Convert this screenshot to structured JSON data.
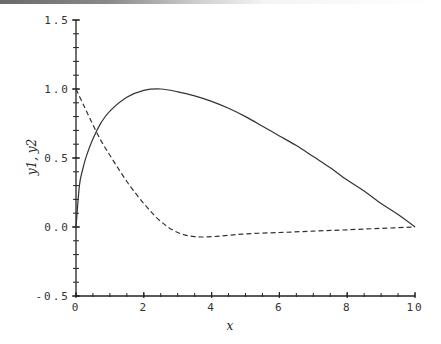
{
  "chart_data": {
    "type": "line",
    "title": "",
    "xlabel": "x",
    "ylabel": "y1, y2",
    "xlim": [
      0,
      10
    ],
    "ylim": [
      -0.5,
      1.5
    ],
    "xticks": [
      0,
      2,
      4,
      6,
      8,
      10
    ],
    "xtick_labels": [
      "0",
      "2",
      "4",
      "6",
      "8",
      "10"
    ],
    "yticks": [
      -0.5,
      0.0,
      0.5,
      1.0,
      1.5
    ],
    "ytick_labels": [
      "-0.5",
      "0.0",
      "0.5",
      "1.0",
      "1.5"
    ],
    "x_minor_step": 0.5,
    "y_minor_step": 0.1,
    "grid": false,
    "legend": null,
    "series": [
      {
        "name": "y1",
        "style": "solid",
        "x": [
          0,
          0.1,
          0.2,
          0.3,
          0.5,
          0.75,
          1.0,
          1.5,
          2.0,
          2.5,
          3.0,
          3.5,
          4.0,
          4.5,
          5.0,
          5.5,
          6.0,
          6.5,
          7.0,
          7.5,
          8.0,
          8.5,
          9.0,
          9.5,
          10.0
        ],
        "y": [
          0.0,
          0.3,
          0.42,
          0.51,
          0.64,
          0.76,
          0.84,
          0.94,
          0.99,
          1.0,
          0.98,
          0.95,
          0.91,
          0.86,
          0.8,
          0.73,
          0.66,
          0.59,
          0.51,
          0.43,
          0.34,
          0.26,
          0.17,
          0.09,
          0.0
        ]
      },
      {
        "name": "y2",
        "style": "dashed",
        "x": [
          0,
          0.25,
          0.5,
          0.75,
          1.0,
          1.5,
          2.0,
          2.5,
          3.0,
          3.5,
          4.0,
          4.5,
          5.0,
          6.0,
          7.0,
          8.0,
          9.0,
          10.0
        ],
        "y": [
          1.0,
          0.87,
          0.74,
          0.62,
          0.52,
          0.33,
          0.17,
          0.04,
          -0.04,
          -0.07,
          -0.07,
          -0.06,
          -0.05,
          -0.04,
          -0.03,
          -0.02,
          -0.01,
          0.0
        ]
      }
    ]
  }
}
